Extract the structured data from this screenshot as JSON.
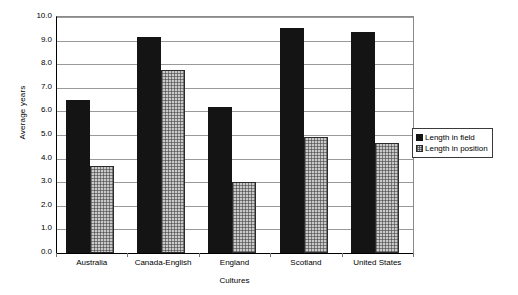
{
  "chart_data": {
    "type": "bar",
    "title": "",
    "xlabel": "Cultures",
    "ylabel": "Average years",
    "ylim": [
      0,
      10
    ],
    "ytick_step": 1,
    "grid": true,
    "legend_position": "right-outside",
    "categories": [
      "Australia",
      "Canada-English",
      "England",
      "Scotland",
      "United States"
    ],
    "ytick_labels": [
      "10.0",
      "9.0",
      "8.0",
      "7.0",
      "6.0",
      "5.0",
      "4.0",
      "3.0",
      "2.0",
      "1.0",
      "0.0"
    ],
    "series": [
      {
        "name": "Length in field",
        "color": "#141414",
        "pattern": "solid",
        "values": [
          6.5,
          9.15,
          6.2,
          9.55,
          9.35
        ]
      },
      {
        "name": "Length in position",
        "color": "#c9c9c9",
        "pattern": "checkered",
        "values": [
          3.7,
          7.75,
          3.0,
          4.9,
          4.65
        ]
      }
    ]
  }
}
